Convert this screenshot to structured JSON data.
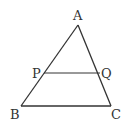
{
  "diagram": {
    "type": "triangle-with-parallel-segment",
    "stroke_color": "#333333",
    "points": {
      "A": {
        "label": "A",
        "x": 78,
        "y": 25
      },
      "B": {
        "label": "B",
        "x": 21,
        "y": 106
      },
      "C": {
        "label": "C",
        "x": 111,
        "y": 106
      },
      "P": {
        "label": "P",
        "x": 44,
        "y": 73
      },
      "Q": {
        "label": "Q",
        "x": 100,
        "y": 73
      }
    },
    "segments": [
      [
        "A",
        "B"
      ],
      [
        "A",
        "C"
      ],
      [
        "B",
        "C"
      ],
      [
        "P",
        "Q"
      ]
    ]
  }
}
